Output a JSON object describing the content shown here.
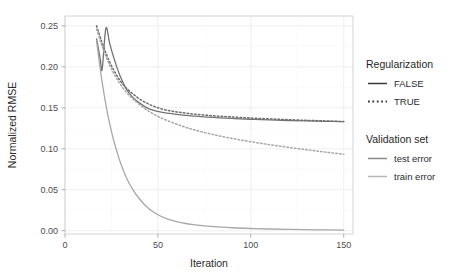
{
  "chart_data": {
    "type": "line",
    "title": "",
    "xlabel": "Iteration",
    "ylabel": "Normalized RMSE",
    "xlim": [
      0,
      155
    ],
    "ylim": [
      -0.004,
      0.262
    ],
    "xticks": [
      0,
      50,
      100,
      150
    ],
    "xticklabels": [
      "0",
      "50",
      "100",
      "150"
    ],
    "yticks": [
      0.0,
      0.05,
      0.1,
      0.15,
      0.2,
      0.25
    ],
    "yticklabels": [
      "0.00",
      "0.05",
      "0.10",
      "0.15",
      "0.20",
      "0.25"
    ],
    "grid": true,
    "legend_position": "right",
    "x": [
      17,
      18,
      19,
      20,
      22,
      24,
      26,
      28,
      30,
      33,
      36,
      40,
      45,
      50,
      55,
      60,
      65,
      70,
      80,
      90,
      100,
      110,
      120,
      130,
      140,
      150
    ],
    "series": [
      {
        "name": "test error, Regularization FALSE",
        "validation_set": "test error",
        "regularization": "FALSE",
        "linetype": "solid",
        "color": "#737373",
        "values": [
          0.234,
          0.222,
          0.209,
          0.197,
          0.247,
          0.229,
          0.213,
          0.199,
          0.187,
          0.173,
          0.164,
          0.156,
          0.149,
          0.1455,
          0.1435,
          0.142,
          0.1408,
          0.1398,
          0.1382,
          0.137,
          0.136,
          0.1352,
          0.1345,
          0.134,
          0.1335,
          0.133
        ]
      },
      {
        "name": "test error, Regularization TRUE",
        "validation_set": "test error",
        "regularization": "TRUE",
        "linetype": "dotted",
        "color": "#6e6e6e",
        "values": [
          0.25,
          0.243,
          0.236,
          0.229,
          0.217,
          0.206,
          0.197,
          0.189,
          0.182,
          0.174,
          0.168,
          0.161,
          0.1545,
          0.15,
          0.147,
          0.145,
          0.1435,
          0.1422,
          0.1402,
          0.1388,
          0.1375,
          0.1365,
          0.1355,
          0.1347,
          0.134,
          0.1332
        ]
      },
      {
        "name": "train error, Regularization FALSE",
        "validation_set": "train error",
        "regularization": "FALSE",
        "linetype": "solid",
        "color": "#a8a8a8",
        "values": [
          0.232,
          0.214,
          0.197,
          0.181,
          0.154,
          0.131,
          0.112,
          0.096,
          0.082,
          0.065,
          0.052,
          0.039,
          0.027,
          0.0195,
          0.0145,
          0.0112,
          0.0088,
          0.0072,
          0.005,
          0.0036,
          0.0027,
          0.0021,
          0.0016,
          0.0013,
          0.001,
          0.0008
        ]
      },
      {
        "name": "train error, Regularization TRUE",
        "validation_set": "train error",
        "regularization": "TRUE",
        "linetype": "dotted",
        "color": "#a8a8a8",
        "values": [
          0.246,
          0.239,
          0.232,
          0.225,
          0.213,
          0.202,
          0.193,
          0.185,
          0.178,
          0.169,
          0.162,
          0.154,
          0.146,
          0.1395,
          0.1345,
          0.13,
          0.1262,
          0.1228,
          0.1172,
          0.1126,
          0.1086,
          0.105,
          0.1018,
          0.0988,
          0.096,
          0.0932
        ]
      }
    ]
  },
  "legend": {
    "groups": [
      {
        "title": "Regularization",
        "items": [
          {
            "label": "FALSE",
            "linetype": "solid",
            "color": "#3a3a3a"
          },
          {
            "label": "TRUE",
            "linetype": "dotted",
            "color": "#3a3a3a"
          }
        ]
      },
      {
        "title": "Validation set",
        "items": [
          {
            "label": "test error",
            "linetype": "solid",
            "color": "#8a8a8a"
          },
          {
            "label": "train error",
            "linetype": "solid",
            "color": "#b5b5b5"
          }
        ]
      }
    ]
  },
  "colors": {
    "panel_border": "#c9c9c9",
    "gridline": "#ebebeb",
    "text": "#2b2b2b",
    "test_error": "#737373",
    "train_error": "#a8a8a8"
  }
}
